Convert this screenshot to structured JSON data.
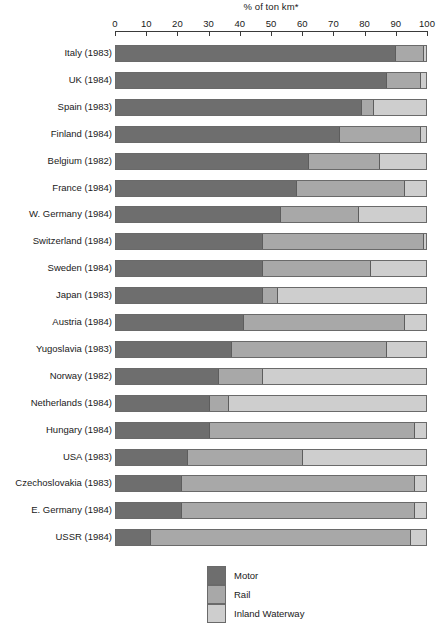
{
  "chart_data": {
    "type": "bar",
    "subtype": "horizontal-stacked-100-percent",
    "title": "% of ton km*",
    "xlabel": "% of ton km*",
    "ylabel": "",
    "xlim": [
      0,
      100
    ],
    "grid": false,
    "legend_position": "bottom-center",
    "tick_labels": [
      "0",
      "10",
      "20",
      "30",
      "40",
      "50",
      "60",
      "70",
      "80",
      "90",
      "100"
    ],
    "ticks": [
      0,
      10,
      20,
      30,
      40,
      50,
      60,
      70,
      80,
      90,
      100
    ],
    "categories": [
      "Italy (1983)",
      "UK (1984)",
      "Spain (1983)",
      "Finland (1984)",
      "Belgium (1982)",
      "France (1984)",
      "W. Germany (1984)",
      "Switzerland (1984)",
      "Sweden (1984)",
      "Japan (1983)",
      "Austria (1984)",
      "Yugoslavia (1983)",
      "Norway (1982)",
      "Netherlands (1984)",
      "Hungary (1984)",
      "USA (1983)",
      "Czechoslovakia (1983)",
      "E. Germany (1984)",
      "USSR (1984)"
    ],
    "series": [
      {
        "name": "Motor",
        "color": "#6e6e6e",
        "values": [
          90,
          87,
          79,
          72,
          62,
          58,
          53,
          47,
          47,
          47,
          41,
          37,
          33,
          30,
          30,
          23,
          21,
          21,
          11
        ]
      },
      {
        "name": "Rail",
        "color": "#a8a8a8",
        "values": [
          9,
          11,
          4,
          26,
          23,
          35,
          25,
          52,
          35,
          5,
          52,
          50,
          14,
          6,
          66,
          37,
          75,
          75,
          84
        ]
      },
      {
        "name": "Inland Waterway",
        "color": "#cecece",
        "values": [
          1,
          2,
          17,
          2,
          15,
          7,
          22,
          1,
          18,
          48,
          7,
          13,
          53,
          64,
          4,
          40,
          4,
          4,
          5
        ]
      }
    ]
  },
  "legend": {
    "items": [
      {
        "label": "Motor",
        "color": "#6e6e6e"
      },
      {
        "label": "Rail",
        "color": "#a8a8a8"
      },
      {
        "label": "Inland Waterway",
        "color": "#cecece"
      }
    ]
  },
  "footnote": {
    "text": ""
  }
}
